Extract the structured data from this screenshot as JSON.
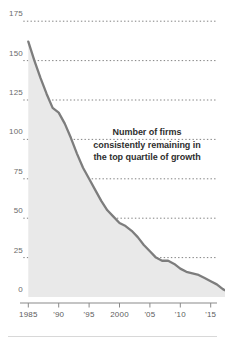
{
  "annotation": {
    "line1": "Number of firms",
    "line2": "consistently remaining in",
    "line3": "the top quartile of growth",
    "full_text": "Number of firms consistently remaining in the top quartile of growth"
  },
  "colors": {
    "line": "#7d7d7d",
    "area_fill": "#e9e9e9",
    "gridline": "#4a4a4a",
    "axis": "#8a8a8a",
    "tick_label": "#6b6b6b",
    "annotation_text": "#2e2e2e",
    "background": "#ffffff",
    "bottom_rule": "#d8d8d8"
  },
  "chart_data": {
    "type": "area",
    "title": "",
    "subtitle": "",
    "xlabel": "",
    "ylabel": "",
    "xlim": [
      1985,
      2018
    ],
    "ylim": [
      0,
      175
    ],
    "grid": true,
    "legend_position": "none",
    "annotations": [
      {
        "text": "Number of firms consistently remaining in the top quartile of growth",
        "x": 2003,
        "y": 98
      }
    ],
    "y_ticks": [
      0,
      25,
      50,
      75,
      100,
      125,
      150,
      175
    ],
    "y_tick_labels": [
      "0",
      "25",
      "50",
      "75",
      "100",
      "125",
      "150",
      "175"
    ],
    "x_ticks": [
      1985,
      1990,
      1995,
      2000,
      2005,
      2010,
      2015
    ],
    "x_tick_labels": [
      "1985",
      "'90",
      "'95",
      "2000",
      "'05",
      "'10",
      "'15"
    ],
    "series": [
      {
        "name": "Number of firms consistently remaining in the top quartile of growth",
        "x": [
          1985,
          1986,
          1987,
          1988,
          1989,
          1990,
          1991,
          1992,
          1993,
          1994,
          1995,
          1996,
          1997,
          1998,
          1999,
          2000,
          2001,
          2002,
          2003,
          2004,
          2005,
          2006,
          2007,
          2008,
          2009,
          2010,
          2011,
          2012,
          2013,
          2014,
          2015,
          2016,
          2017,
          2018
        ],
        "values": [
          162,
          150,
          139,
          129,
          120,
          117,
          110,
          101,
          91,
          82,
          75,
          68,
          61,
          55,
          51,
          47,
          45,
          42,
          38,
          33,
          29,
          25,
          23,
          23,
          21,
          18,
          16,
          15,
          14,
          12,
          10,
          8,
          5,
          3
        ]
      }
    ]
  }
}
